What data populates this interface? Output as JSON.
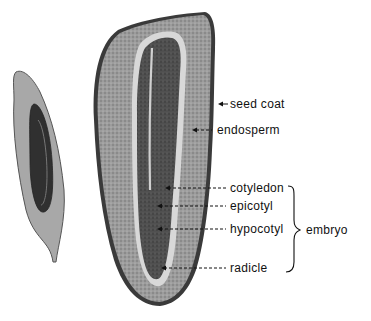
{
  "figure": {
    "type": "labeled cross-section diagram",
    "colors": {
      "background": "#ffffff",
      "endosperm": "#9a9a9a",
      "embryo": "#4a4a4a",
      "outline": "#2a2a2a",
      "text": "#111111"
    }
  },
  "labels": {
    "seed_coat": "seed coat",
    "endosperm": "endosperm",
    "cotyledon": "cotyledon",
    "epicotyl": "epicotyl",
    "hypocotyl": "hypocotyl",
    "radicle": "radicle",
    "embryo": "embryo"
  }
}
